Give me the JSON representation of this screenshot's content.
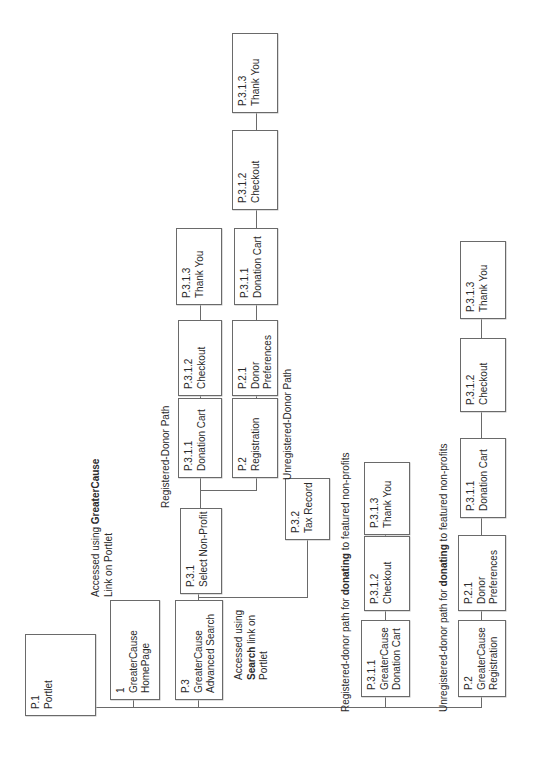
{
  "diagram": {
    "orientation": "rotated -90 degrees (text reads bottom-to-top)",
    "nodes": {
      "portlet": {
        "id": "P.1",
        "title": "Portlet"
      },
      "homepage": {
        "id": "1",
        "title": "GreaterCause",
        "title2": "HomePage"
      },
      "adv_search": {
        "id": "P.3",
        "title": "GreaterCause",
        "title2": "Advanced Search"
      },
      "select_np": {
        "id": "P.3.1",
        "title": "Select Non-Profit"
      },
      "tax_record": {
        "id": "P.3.2",
        "title": "Tax Record"
      },
      "reg_cart": {
        "id": "P.3.1.1",
        "title": "Donation Cart"
      },
      "reg_checkout": {
        "id": "P.3.1.2",
        "title": "Checkout"
      },
      "reg_thanks": {
        "id": "P.3.1.3",
        "title": "Thank You"
      },
      "unreg_registration": {
        "id": "P.2",
        "title": "Registration"
      },
      "unreg_prefs": {
        "id": "P.2.1",
        "title": "Donor",
        "title2": "Preferences"
      },
      "unreg_cart": {
        "id": "P.3.1.1",
        "title": "Donation Cart"
      },
      "unreg_checkout": {
        "id": "P.3.1.2",
        "title": "Checkout"
      },
      "unreg_thanks": {
        "id": "P.3.1.3",
        "title": "Thank You"
      },
      "feat_reg_cart": {
        "id": "P.3.1.1",
        "title": "GreaterCause",
        "title2": "Donation Cart"
      },
      "feat_reg_checkout": {
        "id": "P.3.1.2",
        "title": "Checkout"
      },
      "feat_reg_thanks": {
        "id": "P.3.1.3",
        "title": "Thank You"
      },
      "feat_unreg_registration": {
        "id": "P.2",
        "title": "GreaterCause",
        "title2": "Registration"
      },
      "feat_unreg_prefs": {
        "id": "P.2.1",
        "title": "Donor",
        "title2": "Preferences"
      },
      "feat_unreg_cart": {
        "id": "P.3.1.1",
        "title": "Donation Cart"
      },
      "feat_unreg_checkout": {
        "id": "P.3.1.2",
        "title": "Checkout"
      },
      "feat_unreg_thanks": {
        "id": "P.3.1.3",
        "title": "Thank You"
      }
    },
    "labels": {
      "homepage_access_1": "Accessed using ",
      "homepage_access_bold": "GreaterCause",
      "homepage_access_2": "Link on Portlet",
      "search_access_1": "Accessed using",
      "search_access_bold": "Search",
      "search_access_2": " link on",
      "search_access_3": "Portlet",
      "registered_path": "Registered-Donor Path",
      "unregistered_path": "Unregistered-Donor Path",
      "feat_reg_1": "Registered-donor path for ",
      "feat_reg_bold": "donating",
      "feat_reg_2": " to featured non-profits",
      "feat_unreg_1": "Unregistered-donor path for ",
      "feat_unreg_bold": "donating",
      "feat_unreg_2": " to featured non-profits"
    },
    "colors": {
      "line": "#6a6a6a",
      "text": "#2a2a2a",
      "background": "#ffffff"
    }
  }
}
